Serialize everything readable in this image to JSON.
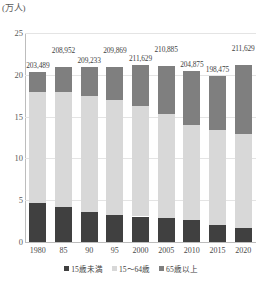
{
  "chart_data": {
    "type": "bar",
    "subtype": "stacked-bar",
    "title": "",
    "xlabel": "",
    "ylabel": "(万人)",
    "ylim": [
      0,
      25
    ],
    "yticks": [
      0,
      5,
      10,
      15,
      20,
      25
    ],
    "grid": true,
    "legend_position": "bottom",
    "categories": [
      "1980",
      "85",
      "90",
      "95",
      "2000",
      "2005",
      "2010",
      "2015",
      "2020"
    ],
    "series": [
      {
        "name": "15歳未満",
        "color": "#404040",
        "values": [
          4.69,
          4.14,
          3.55,
          3.25,
          3.05,
          2.84,
          2.6,
          2.02,
          1.67
        ]
      },
      {
        "name": "15〜64歳",
        "color": "#d8d8d8",
        "values": [
          13.31,
          13.86,
          13.96,
          13.74,
          13.21,
          12.47,
          11.41,
          11.33,
          11.19
        ]
      },
      {
        "name": "65歳以上",
        "color": "#7f7f7f",
        "values": [
          2.3,
          2.9,
          3.41,
          3.99,
          4.9,
          5.78,
          6.47,
          6.52,
          8.3
        ]
      }
    ],
    "totals": [
      20.35,
      20.9,
      20.92,
      20.99,
      21.16,
      21.09,
      20.49,
      19.85,
      21.16
    ],
    "bar_labels": [
      "203,489",
      "208,952",
      "209,233",
      "209,869",
      "211,629",
      "210,885",
      "204,875",
      "198,475",
      "211,629"
    ]
  },
  "legend": {
    "items": [
      {
        "label": "15歳未満",
        "color": "#404040"
      },
      {
        "label": "15〜64歳",
        "color": "#d8d8d8"
      },
      {
        "label": "65歳以上",
        "color": "#7f7f7f"
      }
    ]
  },
  "axis": {
    "unit_label": "(万人)"
  }
}
